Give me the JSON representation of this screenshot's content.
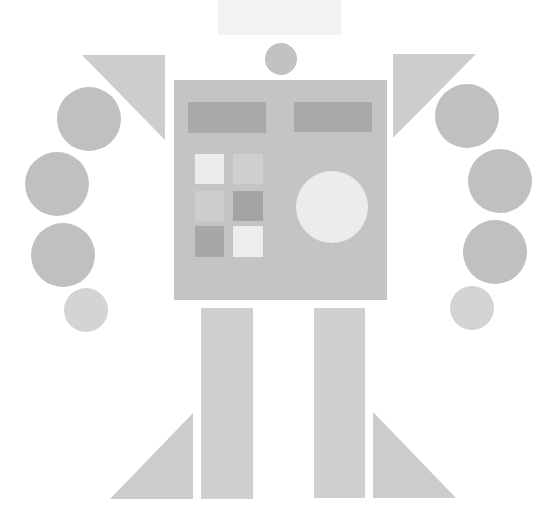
{
  "figure": {
    "background": "#ffffff",
    "width": 555,
    "height": 527
  },
  "colors": {
    "title_block": "#f2f2f2",
    "head": "#c2c2c2",
    "body": "#c4c4c4",
    "panel_dark": "#a9a9a9",
    "shoulder": "#cdcdcd",
    "arm_segment": "#c0c0c0",
    "hand": "#d4d4d4",
    "leg": "#cfcfcf",
    "foot": "#cccccc",
    "eye_circle": "#ececec"
  },
  "title_block": {
    "x": 218,
    "y": 0,
    "w": 123,
    "h": 35
  },
  "head": {
    "cx": 281,
    "cy": 59,
    "r": 16
  },
  "body": {
    "x": 174,
    "y": 80,
    "w": 213,
    "h": 220,
    "panels": [
      {
        "name": "left-panel",
        "x": 188,
        "y": 102,
        "w": 78,
        "h": 31
      },
      {
        "name": "right-panel",
        "x": 294,
        "y": 102,
        "w": 78,
        "h": 30
      }
    ],
    "grid": [
      {
        "name": "grid-r1-c1",
        "x": 195,
        "y": 154,
        "w": 29,
        "h": 30,
        "color": "#ececec"
      },
      {
        "name": "grid-r1-c2",
        "x": 233,
        "y": 154,
        "w": 30,
        "h": 30,
        "color": "#cfcfcf"
      },
      {
        "name": "grid-r2-c1",
        "x": 195,
        "y": 191,
        "w": 29,
        "h": 30,
        "color": "#cdcdcd"
      },
      {
        "name": "grid-r2-c2",
        "x": 233,
        "y": 191,
        "w": 30,
        "h": 30,
        "color": "#a4a4a4"
      },
      {
        "name": "grid-r3-c1",
        "x": 195,
        "y": 226,
        "w": 29,
        "h": 31,
        "color": "#a7a7a7"
      },
      {
        "name": "grid-r3-c2",
        "x": 233,
        "y": 226,
        "w": 30,
        "h": 31,
        "color": "#ededed"
      }
    ],
    "dial": {
      "cx": 332,
      "cy": 207,
      "r": 36
    }
  },
  "shoulders": {
    "left": [
      [
        82,
        55
      ],
      [
        165,
        55
      ],
      [
        165,
        140
      ]
    ],
    "right": [
      [
        393,
        54
      ],
      [
        476,
        54
      ],
      [
        393,
        138
      ]
    ]
  },
  "arms": {
    "left": [
      {
        "cx": 89,
        "cy": 119,
        "r": 32
      },
      {
        "cx": 57,
        "cy": 184,
        "r": 32
      },
      {
        "cx": 63,
        "cy": 255,
        "r": 32
      }
    ],
    "right": [
      {
        "cx": 467,
        "cy": 116,
        "r": 32
      },
      {
        "cx": 500,
        "cy": 181,
        "r": 32
      },
      {
        "cx": 495,
        "cy": 252,
        "r": 32
      }
    ]
  },
  "hands": {
    "left": {
      "cx": 86,
      "cy": 310,
      "r": 22
    },
    "right": {
      "cx": 472,
      "cy": 308,
      "r": 22
    }
  },
  "legs": {
    "left": {
      "x": 201,
      "y": 308,
      "w": 52,
      "h": 191
    },
    "right": {
      "x": 314,
      "y": 308,
      "w": 51,
      "h": 190
    }
  },
  "feet": {
    "left": [
      [
        110,
        499
      ],
      [
        193,
        499
      ],
      [
        193,
        413
      ]
    ],
    "right": [
      [
        373,
        412
      ],
      [
        373,
        498
      ],
      [
        456,
        498
      ]
    ]
  }
}
